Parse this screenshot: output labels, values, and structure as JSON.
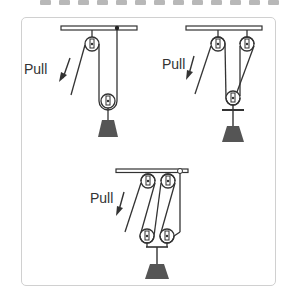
{
  "figure": {
    "systems": [
      {
        "id": "single-movable",
        "label": "Pull",
        "fixed_pulleys": 1,
        "movable_pulleys": 1
      },
      {
        "id": "two-fixed-one-movable",
        "label": "Pull",
        "fixed_pulleys": 2,
        "movable_pulleys": 1
      },
      {
        "id": "two-fixed-two-movable",
        "label": "Pull",
        "fixed_pulleys": 2,
        "movable_pulleys": 2
      }
    ]
  },
  "colors": {
    "line": "#333333",
    "weight": "#555555",
    "frame": "#d0d0d0",
    "dash": "#b8b8b8"
  }
}
